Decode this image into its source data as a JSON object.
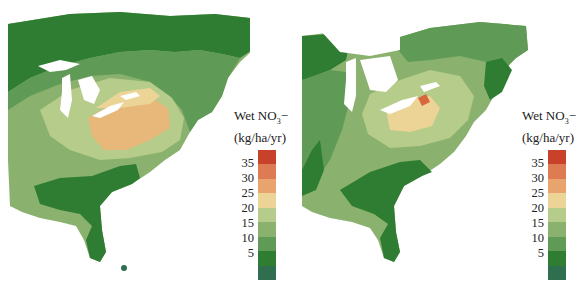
{
  "figure": {
    "panels": [
      {
        "id": "left",
        "legend": {
          "title_main": "Wet NO",
          "title_sub": "3",
          "title_suffix": "−",
          "units": "(kg/ha/yr)",
          "ticks": [
            "35",
            "30",
            "25",
            "20",
            "15",
            "10",
            "5"
          ]
        }
      },
      {
        "id": "right",
        "legend": {
          "title_main": "Wet NO",
          "title_sub": "3",
          "title_suffix": "−",
          "units": "(kg/ha/yr)",
          "ticks": [
            "35",
            "30",
            "25",
            "20",
            "15",
            "10",
            "5"
          ]
        }
      }
    ],
    "color_scale": [
      "#c8412a",
      "#dd7c52",
      "#e8a46c",
      "#ecd497",
      "#b6cc8a",
      "#8ab26e",
      "#5f9a57",
      "#2e7d32",
      "#2f6e4e"
    ],
    "colors": {
      "land_low": "#2e7d32",
      "land_midlow": "#5f9a57",
      "land_mid": "#8ab26e",
      "land_midhigh": "#b6cc8a",
      "land_high": "#e8b77a",
      "land_peak": "#d9673e",
      "water": "#ffffff"
    }
  }
}
